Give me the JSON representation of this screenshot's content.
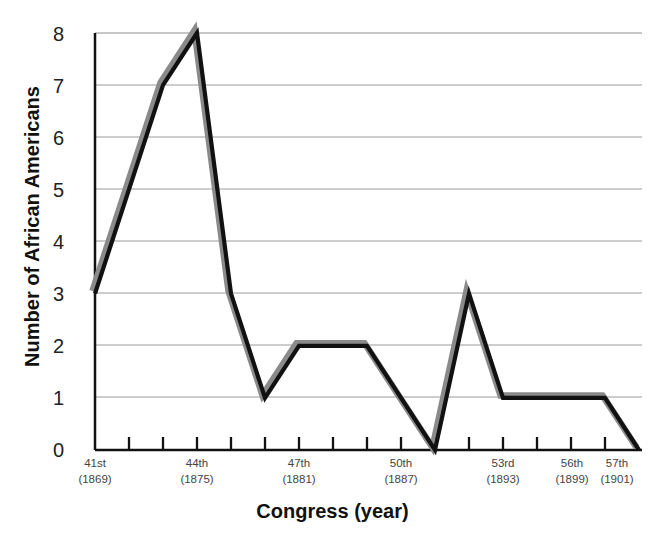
{
  "chart_data": {
    "type": "line",
    "title": "",
    "xlabel": "Congress (year)",
    "ylabel": "Number of African Americans",
    "ylim": [
      0,
      8
    ],
    "yticks": [
      0,
      1,
      2,
      3,
      4,
      5,
      6,
      7,
      8
    ],
    "grid": true,
    "legend": null,
    "x": [
      "41st",
      "42nd",
      "43rd",
      "44th",
      "45th",
      "46th",
      "47th",
      "48th",
      "49th",
      "50th",
      "51st",
      "52nd",
      "53rd",
      "54th",
      "55th",
      "56th",
      "57th"
    ],
    "categories": [
      "41st",
      "42nd",
      "43rd",
      "44th",
      "45th",
      "46th",
      "47th",
      "48th",
      "49th",
      "50th",
      "51st",
      "52nd",
      "53rd",
      "54th",
      "55th",
      "56th",
      "57th"
    ],
    "values": [
      3,
      5,
      7,
      8,
      3,
      1,
      2,
      2,
      2,
      1,
      0,
      3,
      1,
      1,
      1,
      1,
      0
    ],
    "xtick_labels": [
      {
        "index": 0,
        "congress": "41st",
        "year": "(1869)"
      },
      {
        "index": 3,
        "congress": "44th",
        "year": "(1875)"
      },
      {
        "index": 6,
        "congress": "47th",
        "year": "(1881)"
      },
      {
        "index": 9,
        "congress": "50th",
        "year": "(1887)"
      },
      {
        "index": 12,
        "congress": "53rd",
        "year": "(1893)"
      },
      {
        "index": 15,
        "congress": "56th",
        "year": "(1899)"
      },
      {
        "index": 16,
        "congress": "57th",
        "year": "(1901)"
      }
    ],
    "series": [
      {
        "name": "Number of African Americans",
        "values": [
          3,
          5,
          7,
          8,
          3,
          1,
          2,
          2,
          2,
          1,
          0,
          3,
          1,
          1,
          1,
          1,
          0
        ],
        "line_color": "#111111",
        "shadow_color": "#8a8a8a"
      }
    ],
    "colors": {
      "line": "#111111",
      "shadow": "#8a8a8a",
      "grid": "#9a9a9a",
      "axis": "#111111",
      "text": "#222222",
      "background": "#ffffff"
    }
  }
}
